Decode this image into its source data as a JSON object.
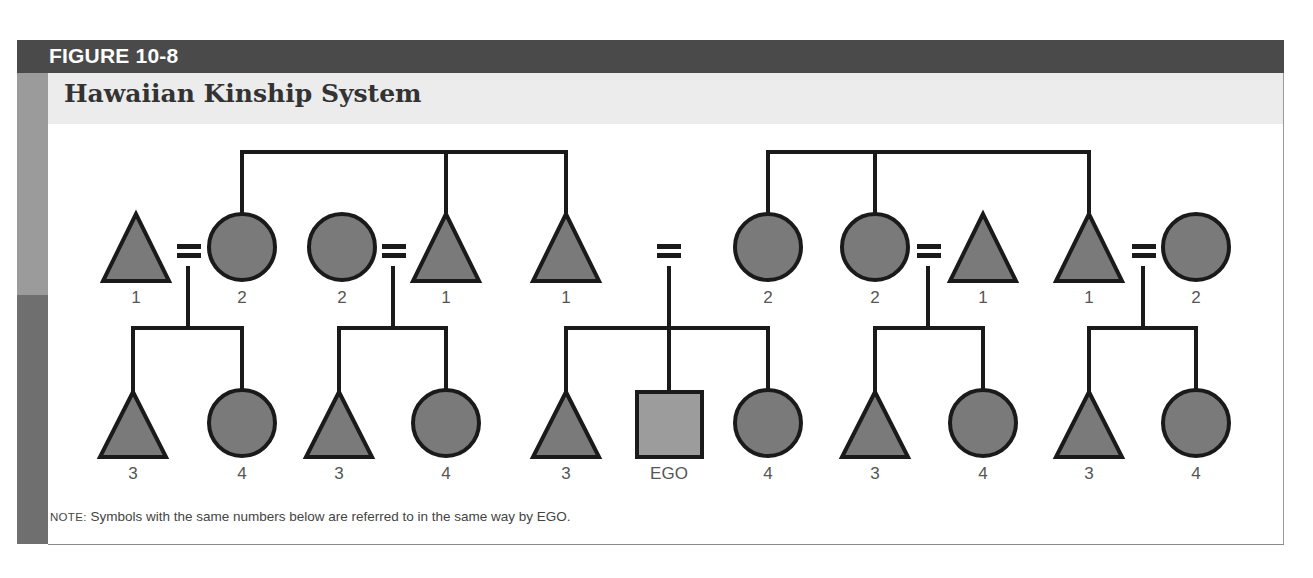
{
  "figure": {
    "label": "FIGURE 10-8",
    "title": "Hawaiian Kinship System"
  },
  "note": {
    "prefix": "NOTE:",
    "text": " Symbols with the same numbers below are referred to in the same way by EGO."
  },
  "colors": {
    "header_band": "#4a4a4a",
    "title_band": "#ececec",
    "symbol_fill": "#7a7a7a",
    "ego_fill": "#9c9c9c",
    "stroke": "#1a1a1a",
    "side_bar_light": "#9b9b9b",
    "side_bar_dark": "#6f6f6f"
  },
  "diagram": {
    "parent_generation": [
      {
        "shape": "triangle",
        "x": 136,
        "label": "1"
      },
      {
        "shape": "circle",
        "x": 242,
        "label": "2"
      },
      {
        "shape": "circle",
        "x": 342,
        "label": "2"
      },
      {
        "shape": "triangle",
        "x": 446,
        "label": "1"
      },
      {
        "shape": "triangle",
        "x": 566,
        "label": "1"
      },
      {
        "shape": "circle",
        "x": 768,
        "label": "2"
      },
      {
        "shape": "circle",
        "x": 875,
        "label": "2"
      },
      {
        "shape": "triangle",
        "x": 983,
        "label": "1"
      },
      {
        "shape": "triangle",
        "x": 1089,
        "label": "1"
      },
      {
        "shape": "circle",
        "x": 1196,
        "label": "2"
      }
    ],
    "ego_generation": [
      {
        "shape": "triangle",
        "x": 133,
        "label": "3"
      },
      {
        "shape": "circle",
        "x": 242,
        "label": "4"
      },
      {
        "shape": "triangle",
        "x": 339,
        "label": "3"
      },
      {
        "shape": "circle",
        "x": 446,
        "label": "4"
      },
      {
        "shape": "triangle",
        "x": 566,
        "label": "3"
      },
      {
        "shape": "square",
        "x": 669,
        "label": "EGO"
      },
      {
        "shape": "circle",
        "x": 768,
        "label": "4"
      },
      {
        "shape": "triangle",
        "x": 875,
        "label": "3"
      },
      {
        "shape": "circle",
        "x": 983,
        "label": "4"
      },
      {
        "shape": "triangle",
        "x": 1089,
        "label": "3"
      },
      {
        "shape": "circle",
        "x": 1196,
        "label": "4"
      }
    ]
  }
}
